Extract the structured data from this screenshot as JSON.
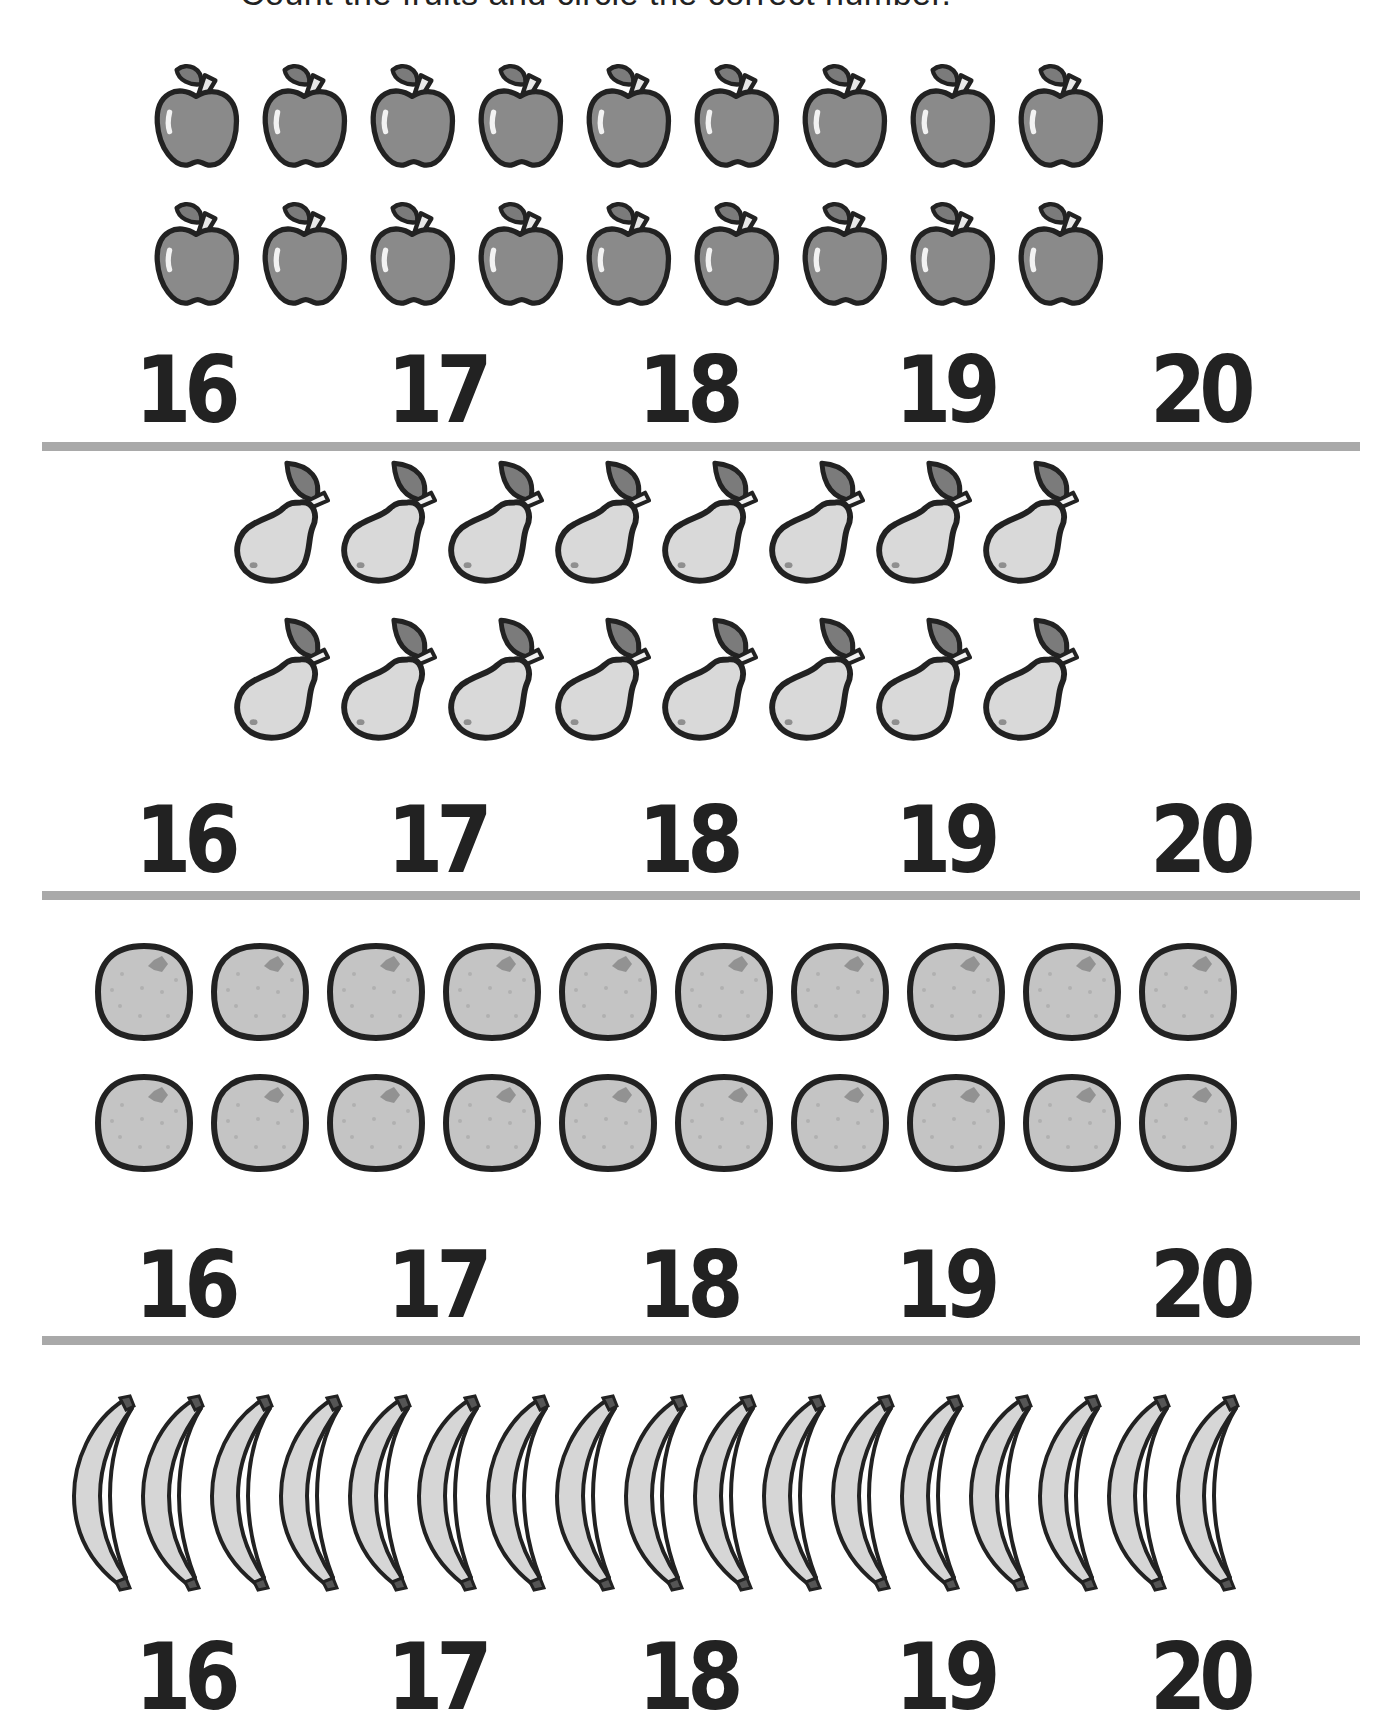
{
  "page": {
    "title_cut_text": "Count the fruits and circle the correct number."
  },
  "colors": {
    "ink": "#222222",
    "apple_fill": "#8a8a8a",
    "pear_fill": "#d9d9d9",
    "orange_fill": "#c4c4c4",
    "banana_fill": "#d6d6d6",
    "leaf_fill": "#7b7b7b",
    "rule": "#a9a9a9"
  },
  "sections": [
    {
      "fruit": "apple",
      "icon": "apple-icon",
      "rows": [
        9,
        9
      ],
      "total": 18,
      "choices": [
        "16",
        "17",
        "18",
        "19",
        "20"
      ]
    },
    {
      "fruit": "pear",
      "icon": "pear-icon",
      "rows": [
        8,
        8
      ],
      "total": 16,
      "choices": [
        "16",
        "17",
        "18",
        "19",
        "20"
      ]
    },
    {
      "fruit": "orange",
      "icon": "orange-icon",
      "rows": [
        10,
        10
      ],
      "total": 20,
      "choices": [
        "16",
        "17",
        "18",
        "19",
        "20"
      ]
    },
    {
      "fruit": "banana",
      "icon": "banana-icon",
      "rows": [
        17
      ],
      "total": 17,
      "choices": [
        "16",
        "17",
        "18",
        "19",
        "20"
      ]
    }
  ]
}
